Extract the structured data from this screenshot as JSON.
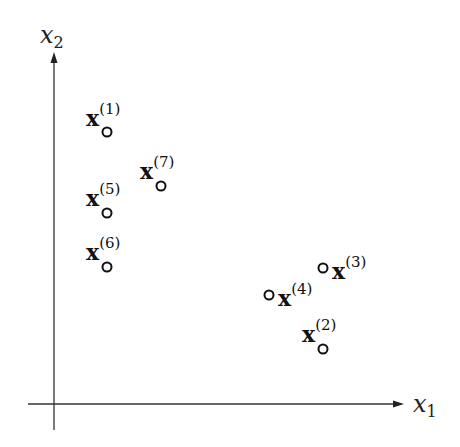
{
  "diagram": {
    "type": "2d-scatter-diagram",
    "axes": {
      "x": {
        "label_var": "x",
        "label_sub": "1"
      },
      "y": {
        "label_var": "x",
        "label_sub": "2"
      }
    },
    "points": [
      {
        "id": "1",
        "symbol": "x",
        "sup": "(1)",
        "cx": 107,
        "cy": 132,
        "label_pos": "above-left"
      },
      {
        "id": "2",
        "symbol": "x",
        "sup": "(2)",
        "cx": 323,
        "cy": 349,
        "label_pos": "above-left"
      },
      {
        "id": "3",
        "symbol": "x",
        "sup": "(3)",
        "cx": 323,
        "cy": 268,
        "label_pos": "right"
      },
      {
        "id": "4",
        "symbol": "x",
        "sup": "(4)",
        "cx": 269,
        "cy": 295,
        "label_pos": "right"
      },
      {
        "id": "5",
        "symbol": "x",
        "sup": "(5)",
        "cx": 107,
        "cy": 213,
        "label_pos": "above-left"
      },
      {
        "id": "6",
        "symbol": "x",
        "sup": "(6)",
        "cx": 107,
        "cy": 267,
        "label_pos": "above-left"
      },
      {
        "id": "7",
        "symbol": "x",
        "sup": "(7)",
        "cx": 161,
        "cy": 186,
        "label_pos": "above-left"
      }
    ],
    "colors": {
      "axis": "#333333",
      "point_stroke": "#111111",
      "background": "#ffffff"
    }
  }
}
